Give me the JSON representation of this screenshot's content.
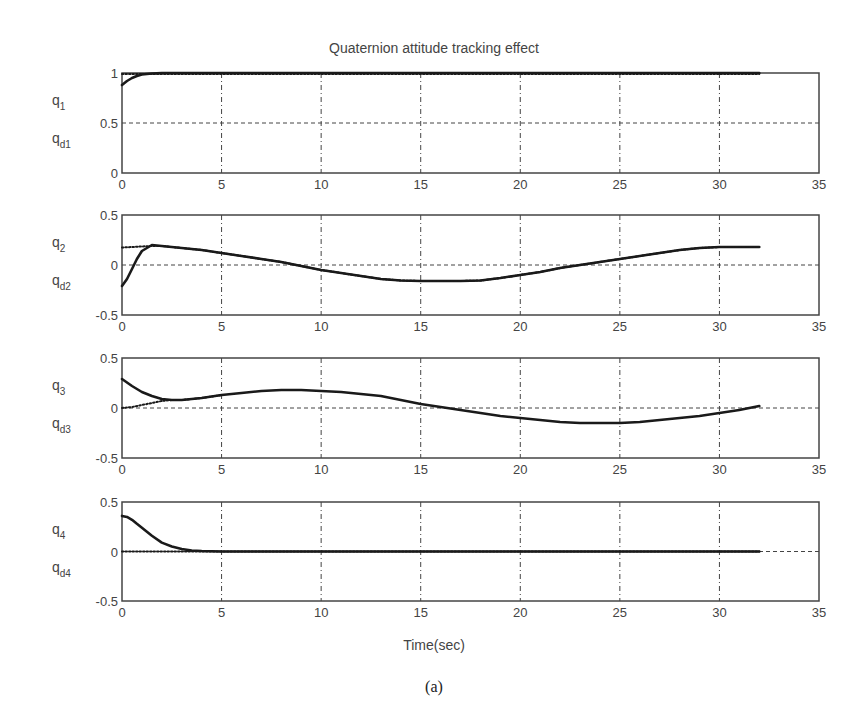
{
  "figure": {
    "title": "Quaternion attitude tracking effect",
    "xlabel": "Time(sec)",
    "caption": "(a)"
  },
  "chart_data": [
    {
      "type": "line",
      "title": "Quaternion attitude tracking effect",
      "xlabel": "",
      "ylabel": "q_1 / q_d1",
      "ylabel_top": "q1",
      "ylabel_bottom": "qd1",
      "xlim": [
        0,
        35
      ],
      "ylim": [
        0,
        1
      ],
      "xticks": [
        0,
        5,
        10,
        15,
        20,
        25,
        30,
        35
      ],
      "yticks": [
        0,
        0.5,
        1
      ],
      "ytick_labels": [
        "0",
        "0.5",
        "1"
      ],
      "grid": true,
      "series": [
        {
          "name": "q1",
          "style": "solid",
          "x": [
            0,
            0.25,
            0.5,
            0.75,
            1,
            1.5,
            2,
            5,
            10,
            15,
            20,
            25,
            30,
            32
          ],
          "y": [
            0.88,
            0.92,
            0.95,
            0.97,
            0.985,
            0.995,
            1.0,
            1.0,
            1.0,
            1.0,
            1.0,
            1.0,
            1.0,
            1.0
          ]
        },
        {
          "name": "qd1",
          "style": "dotted",
          "x": [
            0,
            5,
            10,
            15,
            20,
            25,
            30,
            32
          ],
          "y": [
            0.99,
            0.99,
            0.99,
            0.99,
            0.99,
            0.99,
            0.99,
            0.99
          ]
        }
      ]
    },
    {
      "type": "line",
      "ylabel": "q_2 / q_d2",
      "ylabel_top": "q2",
      "ylabel_bottom": "qd2",
      "xlim": [
        0,
        35
      ],
      "ylim": [
        -0.5,
        0.5
      ],
      "xticks": [
        0,
        5,
        10,
        15,
        20,
        25,
        30,
        35
      ],
      "yticks": [
        -0.5,
        0,
        0.5
      ],
      "ytick_labels": [
        "-0.5",
        "0",
        "0.5"
      ],
      "grid": true,
      "series": [
        {
          "name": "q2",
          "style": "solid",
          "x": [
            0,
            0.25,
            0.5,
            0.75,
            1,
            1.5,
            2,
            3,
            4,
            5,
            6,
            7,
            8,
            9,
            10,
            11,
            12,
            13,
            14,
            15,
            16,
            17,
            18,
            19,
            20,
            21,
            22,
            23,
            24,
            25,
            26,
            27,
            28,
            29,
            30,
            31,
            32
          ],
          "y": [
            -0.21,
            -0.14,
            -0.04,
            0.06,
            0.14,
            0.2,
            0.19,
            0.17,
            0.15,
            0.12,
            0.09,
            0.06,
            0.03,
            -0.01,
            -0.05,
            -0.08,
            -0.11,
            -0.14,
            -0.155,
            -0.16,
            -0.16,
            -0.16,
            -0.155,
            -0.13,
            -0.1,
            -0.07,
            -0.03,
            0.0,
            0.03,
            0.06,
            0.09,
            0.12,
            0.15,
            0.17,
            0.18,
            0.18,
            0.18
          ]
        },
        {
          "name": "qd2",
          "style": "dotted",
          "x": [
            0,
            1.5,
            2,
            3,
            4,
            5,
            6,
            7,
            8,
            9,
            10,
            11,
            12,
            13,
            14,
            15,
            16,
            17,
            18,
            19,
            20,
            21,
            22,
            23,
            24,
            25,
            26,
            27,
            28,
            29,
            30,
            31,
            32
          ],
          "y": [
            0.175,
            0.19,
            0.19,
            0.17,
            0.15,
            0.12,
            0.09,
            0.06,
            0.03,
            -0.01,
            -0.05,
            -0.08,
            -0.11,
            -0.14,
            -0.155,
            -0.16,
            -0.16,
            -0.16,
            -0.155,
            -0.13,
            -0.1,
            -0.07,
            -0.03,
            0.0,
            0.03,
            0.06,
            0.09,
            0.12,
            0.15,
            0.17,
            0.18,
            0.18,
            0.18
          ]
        }
      ]
    },
    {
      "type": "line",
      "ylabel": "q_3 / q_d3",
      "ylabel_top": "q3",
      "ylabel_bottom": "qd3",
      "xlim": [
        0,
        35
      ],
      "ylim": [
        -0.5,
        0.5
      ],
      "xticks": [
        0,
        5,
        10,
        15,
        20,
        25,
        30,
        35
      ],
      "yticks": [
        -0.5,
        0,
        0.5
      ],
      "ytick_labels": [
        "-0.5",
        "0",
        "0.5"
      ],
      "grid": true,
      "series": [
        {
          "name": "q3",
          "style": "solid",
          "x": [
            0,
            0.5,
            1,
            1.5,
            2,
            2.5,
            3,
            4,
            5,
            6,
            7,
            8,
            9,
            10,
            11,
            12,
            13,
            14,
            15,
            16,
            17,
            18,
            19,
            20,
            21,
            22,
            23,
            24,
            25,
            26,
            27,
            28,
            29,
            30,
            31,
            32
          ],
          "y": [
            0.29,
            0.22,
            0.16,
            0.12,
            0.09,
            0.08,
            0.08,
            0.1,
            0.13,
            0.15,
            0.17,
            0.18,
            0.18,
            0.17,
            0.16,
            0.14,
            0.12,
            0.08,
            0.04,
            0.01,
            -0.02,
            -0.05,
            -0.08,
            -0.1,
            -0.12,
            -0.14,
            -0.15,
            -0.15,
            -0.15,
            -0.14,
            -0.12,
            -0.1,
            -0.08,
            -0.05,
            -0.02,
            0.02
          ]
        },
        {
          "name": "qd3",
          "style": "dotted",
          "x": [
            0,
            0.5,
            1,
            1.5,
            2,
            2.5,
            3,
            4,
            5
          ],
          "y": [
            0.0,
            0.01,
            0.03,
            0.05,
            0.07,
            0.08,
            0.08,
            0.1,
            0.13
          ]
        }
      ]
    },
    {
      "type": "line",
      "ylabel": "q_4 / q_d4",
      "ylabel_top": "q4",
      "ylabel_bottom": "qd4",
      "xlabel": "Time(sec)",
      "xlim": [
        0,
        35
      ],
      "ylim": [
        -0.5,
        0.5
      ],
      "xticks": [
        0,
        5,
        10,
        15,
        20,
        25,
        30,
        35
      ],
      "yticks": [
        -0.5,
        0,
        0.5
      ],
      "ytick_labels": [
        "-0.5",
        "0",
        "0.5"
      ],
      "grid": true,
      "series": [
        {
          "name": "q4",
          "style": "solid",
          "x": [
            0,
            0.25,
            0.5,
            0.75,
            1,
            1.5,
            2,
            2.5,
            3,
            3.5,
            4,
            5,
            10,
            15,
            20,
            25,
            30,
            32
          ],
          "y": [
            0.36,
            0.35,
            0.32,
            0.28,
            0.24,
            0.16,
            0.09,
            0.05,
            0.025,
            0.01,
            0.005,
            0.0,
            0.0,
            0.0,
            0.0,
            0.0,
            0.0,
            0.0
          ]
        },
        {
          "name": "qd4",
          "style": "dotted",
          "x": [
            0,
            32
          ],
          "y": [
            0.0,
            0.0
          ]
        }
      ]
    }
  ]
}
